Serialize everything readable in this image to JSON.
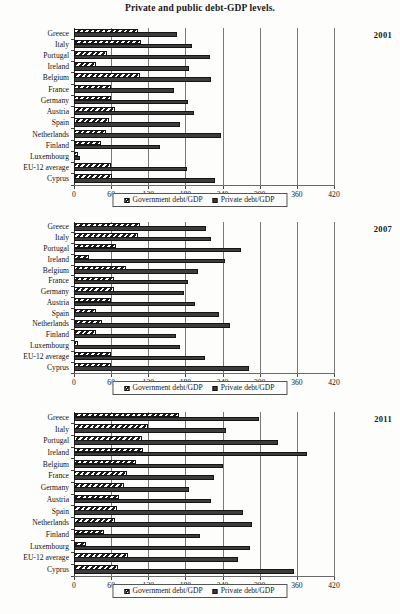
{
  "figure": {
    "title": "Private and public debt-GDP levels."
  },
  "legend": {
    "gov_label": "Government debt/GDP",
    "priv_label": "Private debt/GDP"
  },
  "axis": {
    "ticks": [
      0,
      60,
      120,
      180,
      240,
      300,
      360,
      420
    ],
    "tick_labels": [
      "0",
      "60",
      "120",
      "180",
      "240",
      "300",
      "360",
      "420"
    ],
    "min": 0,
    "max": 420
  },
  "categories": [
    "Greece",
    "Italy",
    "Portugal",
    "Ireland",
    "Belgium",
    "France",
    "Germany",
    "Austria",
    "Spain",
    "Netherlands",
    "Finland",
    "Luxembourg",
    "EU-12 average",
    "Cyprus"
  ],
  "panels": [
    {
      "year": "2001"
    },
    {
      "year": "2007"
    },
    {
      "year": "2011"
    }
  ],
  "chart_data": [
    {
      "type": "bar",
      "title": "Private and public debt-GDP levels.",
      "subtitle": "2001",
      "orientation": "horizontal",
      "xlabel": "",
      "ylabel": "",
      "xlim": [
        0,
        420
      ],
      "grid": true,
      "legend_position": "bottom",
      "categories": [
        "Greece",
        "Italy",
        "Portugal",
        "Ireland",
        "Belgium",
        "France",
        "Germany",
        "Austria",
        "Spain",
        "Netherlands",
        "Finland",
        "Luxembourg",
        "EU-12 average",
        "Cyprus"
      ],
      "series": [
        {
          "name": "Government debt/GDP",
          "values": [
            104,
            108,
            54,
            35,
            107,
            59,
            59,
            67,
            56,
            51,
            43,
            7,
            59,
            61
          ]
        },
        {
          "name": "Private debt/GDP",
          "values": [
            166,
            190,
            220,
            186,
            222,
            162,
            184,
            194,
            171,
            238,
            139,
            10,
            183,
            228
          ]
        }
      ]
    },
    {
      "type": "bar",
      "title": "Private and public debt-GDP levels.",
      "subtitle": "2007",
      "orientation": "horizontal",
      "xlabel": "",
      "ylabel": "",
      "xlim": [
        0,
        420
      ],
      "grid": true,
      "legend_position": "bottom",
      "categories": [
        "Greece",
        "Italy",
        "Portugal",
        "Ireland",
        "Belgium",
        "France",
        "Germany",
        "Austria",
        "Spain",
        "Netherlands",
        "Finland",
        "Luxembourg",
        "EU-12 average",
        "Cyprus"
      ],
      "series": [
        {
          "name": "Government debt/GDP",
          "values": [
            107,
            103,
            68,
            25,
            84,
            64,
            65,
            60,
            36,
            45,
            35,
            7,
            59,
            59
          ]
        },
        {
          "name": "Private debt/GDP",
          "values": [
            213,
            222,
            270,
            244,
            200,
            184,
            178,
            196,
            235,
            252,
            164,
            172,
            211,
            282
          ]
        }
      ]
    },
    {
      "type": "bar",
      "title": "Private and public debt-GDP levels.",
      "subtitle": "2011",
      "orientation": "horizontal",
      "xlabel": "",
      "ylabel": "",
      "xlim": [
        0,
        420
      ],
      "grid": true,
      "legend_position": "bottom",
      "categories": [
        "Greece",
        "Italy",
        "Portugal",
        "Ireland",
        "Belgium",
        "France",
        "Germany",
        "Austria",
        "Spain",
        "Netherlands",
        "Finland",
        "Luxembourg",
        "EU-12 average",
        "Cyprus"
      ],
      "series": [
        {
          "name": "Government debt/GDP",
          "values": [
            170,
            120,
            110,
            112,
            100,
            86,
            81,
            72,
            69,
            66,
            49,
            19,
            88,
            71
          ]
        },
        {
          "name": "Private debt/GDP",
          "values": [
            299,
            245,
            330,
            377,
            241,
            226,
            186,
            221,
            273,
            288,
            203,
            284,
            265,
            355
          ]
        }
      ]
    }
  ]
}
